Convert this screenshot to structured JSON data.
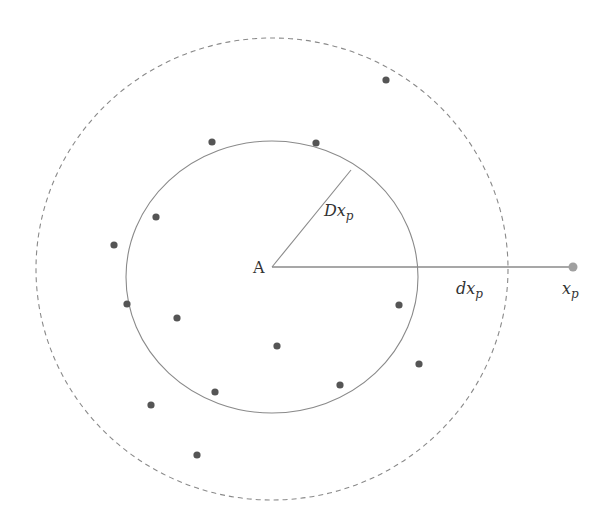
{
  "diagram": {
    "center": {
      "label": "A",
      "x": 272,
      "y": 267
    },
    "inner_circle": {
      "cx": 272,
      "cy": 277,
      "rx": 146,
      "ry": 136,
      "style": "solid",
      "stroke": "#8a8a8a"
    },
    "outer_circle": {
      "cx": 272,
      "cy": 269,
      "rx": 236,
      "ry": 231,
      "style": "dashed",
      "stroke": "#8a8a8a"
    },
    "radius_line": {
      "x1": 272,
      "y1": 267,
      "x2": 351,
      "y2": 170,
      "label_main": "Dx",
      "label_sub": "p"
    },
    "distance_line": {
      "x1": 272,
      "y1": 267,
      "x2": 573,
      "y2": 267,
      "label_main": "dx",
      "label_sub": "p"
    },
    "query_point": {
      "x": 573,
      "y": 267,
      "label_main": "x",
      "label_sub": "p",
      "color": "#a0a0a0"
    },
    "points_color": "#555555",
    "points": [
      {
        "x": 386,
        "y": 80
      },
      {
        "x": 212,
        "y": 142
      },
      {
        "x": 316,
        "y": 143
      },
      {
        "x": 156,
        "y": 217
      },
      {
        "x": 114,
        "y": 245
      },
      {
        "x": 127,
        "y": 304
      },
      {
        "x": 177,
        "y": 318
      },
      {
        "x": 399,
        "y": 305
      },
      {
        "x": 277,
        "y": 346
      },
      {
        "x": 419,
        "y": 364
      },
      {
        "x": 340,
        "y": 385
      },
      {
        "x": 215,
        "y": 392
      },
      {
        "x": 151,
        "y": 405
      },
      {
        "x": 197,
        "y": 455
      }
    ]
  }
}
